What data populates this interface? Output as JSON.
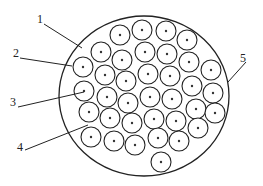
{
  "diagram": {
    "type": "cross-section of bundled fibers/strands in circular sheath",
    "outer_circle": {
      "cx": 144,
      "cy": 96,
      "rx": 85,
      "ry": 80
    },
    "strand_radius": 10,
    "strands": [
      [
        120,
        35
      ],
      [
        142,
        30
      ],
      [
        166,
        31
      ],
      [
        187,
        40
      ],
      [
        101,
        52
      ],
      [
        122,
        60
      ],
      [
        145,
        52
      ],
      [
        167,
        54
      ],
      [
        189,
        62
      ],
      [
        211,
        70
      ],
      [
        83,
        67
      ],
      [
        105,
        75
      ],
      [
        126,
        81
      ],
      [
        148,
        74
      ],
      [
        170,
        76
      ],
      [
        192,
        86
      ],
      [
        213,
        93
      ],
      [
        84,
        91
      ],
      [
        107,
        97
      ],
      [
        128,
        103
      ],
      [
        150,
        97
      ],
      [
        172,
        99
      ],
      [
        196,
        109
      ],
      [
        215,
        113
      ],
      [
        89,
        112
      ],
      [
        110,
        118
      ],
      [
        132,
        123
      ],
      [
        154,
        119
      ],
      [
        176,
        121
      ],
      [
        198,
        128
      ],
      [
        91,
        137
      ],
      [
        114,
        141
      ],
      [
        135,
        145
      ],
      [
        158,
        138
      ],
      [
        179,
        141
      ],
      [
        161,
        162
      ]
    ],
    "labels": [
      {
        "text": "1",
        "x": 40,
        "y": 23,
        "line": [
          44,
          24,
          82,
          48
        ]
      },
      {
        "text": "2",
        "x": 16,
        "y": 57,
        "line": [
          20,
          58,
          72,
          66
        ]
      },
      {
        "text": "3",
        "x": 13,
        "y": 106,
        "line": [
          18,
          107,
          84,
          92
        ]
      },
      {
        "text": "4",
        "x": 20,
        "y": 151,
        "line": [
          25,
          150,
          88,
          125
        ]
      },
      {
        "text": "5",
        "x": 243,
        "y": 62,
        "line": [
          246,
          62,
          228,
          82
        ]
      }
    ]
  }
}
